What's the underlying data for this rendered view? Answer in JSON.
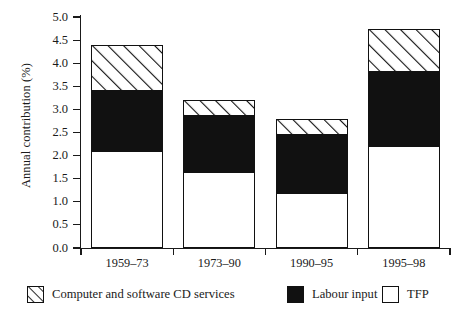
{
  "chart_data": {
    "type": "bar",
    "title": "",
    "subtitle": "",
    "xlabel": "",
    "ylabel": "Annual contribution (%)",
    "categories": [
      "1959–73",
      "1973–90",
      "1990–95",
      "1995–98"
    ],
    "stacked": true,
    "grid": false,
    "legend_position": "bottom",
    "ylim": [
      0.0,
      5.0
    ],
    "ytick_step": 0.5,
    "ytick_labels": [
      "0.0",
      "0.5",
      "1.0",
      "1.5",
      "2.0",
      "2.5",
      "3.0",
      "3.5",
      "4.0",
      "4.5",
      "5.0"
    ],
    "ytick_values": [
      0.0,
      0.5,
      1.0,
      1.5,
      2.0,
      2.5,
      3.0,
      3.5,
      4.0,
      4.5,
      5.0
    ],
    "series": [
      {
        "name": "TFP",
        "fill": "white",
        "color": "#ffffff",
        "values": [
          2.1,
          1.65,
          1.2,
          2.2
        ]
      },
      {
        "name": "Labour input",
        "fill": "solid-black",
        "color": "#111111",
        "values": [
          1.3,
          1.2,
          1.25,
          1.6
        ]
      },
      {
        "name": "Computer and software CD services",
        "fill": "diagonal-hatch",
        "color": "#ffffff",
        "values": [
          1.0,
          0.35,
          0.35,
          0.95
        ]
      }
    ],
    "stack_order_bottom_to_top": [
      "TFP",
      "Labour input",
      "Computer and software CD services"
    ],
    "totals": [
      4.4,
      3.2,
      2.8,
      4.75
    ],
    "annotations": []
  },
  "legend": {
    "items": [
      {
        "label": "Computer and software CD services",
        "swatch": "diagonal-hatch-swatch"
      },
      {
        "label": "Labour input",
        "swatch": "solid-black-swatch"
      },
      {
        "label": "TFP",
        "swatch": "white-swatch"
      }
    ]
  }
}
